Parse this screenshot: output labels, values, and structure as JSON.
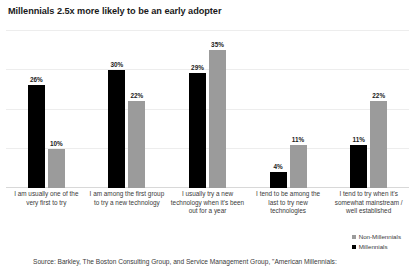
{
  "title": "Millennials 2.5x more likely to be an early adopter",
  "source": "Source: Barkley, The Boston Consulting Group, and Service Management Group, \"American Millennials:",
  "legend": {
    "items": [
      {
        "label": "Non-Millennials",
        "color": "#9b9b9b"
      },
      {
        "label": "Millennials",
        "color": "#000000"
      }
    ]
  },
  "chart_data": {
    "type": "bar",
    "title": "Millennials 2.5x more likely to be an early adopter",
    "xlabel": "",
    "ylabel": "",
    "ylim": [
      0,
      40
    ],
    "grid": true,
    "legend_position": "bottom-right",
    "categories": [
      "I am usually one of the very first to try",
      "I am among the first group to try a new technology",
      "I usually try a new technology when it's been out for a year",
      "I tend to be among the last to try new technologies",
      "I tend to try when it's somewhat mainstream / well established"
    ],
    "series": [
      {
        "name": "Millennials",
        "color": "#000000",
        "values": [
          26,
          30,
          29,
          4,
          11
        ],
        "labels": [
          "26%",
          "30%",
          "29%",
          "4%",
          "11%"
        ]
      },
      {
        "name": "Non-Millennials",
        "color": "#9b9b9b",
        "values": [
          10,
          22,
          35,
          11,
          22
        ],
        "labels": [
          "10%",
          "22%",
          "35%",
          "11%",
          "22%"
        ]
      }
    ]
  }
}
